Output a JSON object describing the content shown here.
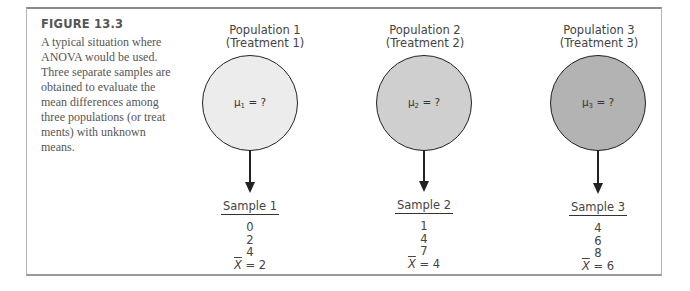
{
  "figure": {
    "label": "FIGURE 13.3",
    "caption_lines": [
      "A typical situation where",
      "ANOVA would be used.",
      "Three separate samples are",
      "obtained to evaluate the",
      "mean differences among",
      "three populations (or treat",
      "ments) with unknown",
      "means."
    ]
  },
  "populations": [
    {
      "title": "Population 1",
      "subtitle": "(Treatment 1)",
      "mu_symbol": "μ",
      "mu_sub": "1",
      "mu_rest": " = ?",
      "fill": "#ececec"
    },
    {
      "title": "Population 2",
      "subtitle": "(Treatment 2)",
      "mu_symbol": "μ",
      "mu_sub": "2",
      "mu_rest": " = ?",
      "fill": "#cfcfcf"
    },
    {
      "title": "Population 3",
      "subtitle": "(Treatment 3)",
      "mu_symbol": "μ",
      "mu_sub": "3",
      "mu_rest": " = ?",
      "fill": "#b3b3b3"
    }
  ],
  "samples": [
    {
      "title": "Sample 1",
      "values": [
        "0",
        "2",
        "4"
      ],
      "mean_symbol": "X",
      "mean_rest": " = 2"
    },
    {
      "title": "Sample 2",
      "values": [
        "1",
        "4",
        "7"
      ],
      "mean_symbol": "X",
      "mean_rest": " = 4"
    },
    {
      "title": "Sample 3",
      "values": [
        "4",
        "6",
        "8"
      ],
      "mean_symbol": "X",
      "mean_rest": " = 6"
    }
  ]
}
